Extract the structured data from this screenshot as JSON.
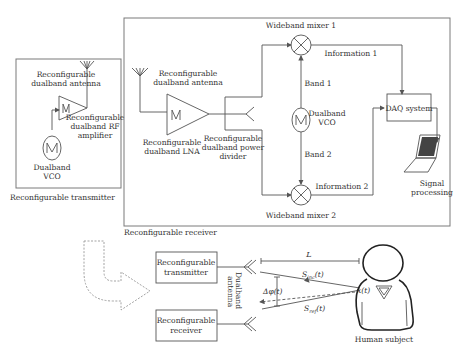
{
  "transmitter": {
    "caption": "Reconfigurable transmitter",
    "antenna_label_1": "Reconfigurable",
    "antenna_label_2": "dualband antenna",
    "amp_label_1": "Reconfigurable",
    "amp_label_2": "dualband RF",
    "amp_label_3": "amplifier",
    "vco_label_1": "Dualband",
    "vco_label_2": "VCO"
  },
  "receiver": {
    "caption": "Reconfigurable receiver",
    "antenna_label_1": "Reconfigurable",
    "antenna_label_2": "dualband antenna",
    "lna_label_1": "Reconfigurable",
    "lna_label_2": "dualband LNA",
    "divider_label_1": "Reconfigurable",
    "divider_label_2": "dualband power",
    "divider_label_3": "divider",
    "mixer1_label": "Wideband mixer 1",
    "mixer2_label": "Wideband mixer 2",
    "band1_label": "Band 1",
    "band2_label": "Band 2",
    "vco_label_1": "Dualband",
    "vco_label_2": "VCO",
    "info1_label": "Information 1",
    "info2_label": "Information 2",
    "daq_label": "DAQ system",
    "sp_label_1": "Signal",
    "sp_label_2": "processing"
  },
  "system": {
    "tx_box_1": "Reconfigurable",
    "tx_box_2": "transmitter",
    "rx_box_1": "Reconfigurable",
    "rx_box_2": "receiver",
    "antenna_vertical_1": "Dualband",
    "antenna_vertical_2": "antenna",
    "distance_label": "L",
    "s_inc": "S",
    "s_inc_sub": "inc",
    "s_inc_arg": "(t)",
    "s_ref": "S",
    "s_ref_sub": "ref",
    "s_ref_arg": "(t)",
    "phase_label": "Δφ(t)",
    "x_label": "x(t)",
    "subject_label": "Human subject"
  }
}
